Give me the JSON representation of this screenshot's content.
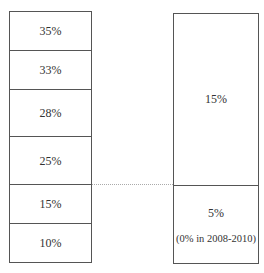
{
  "left_stack": {
    "segments": [
      {
        "label": "35%"
      },
      {
        "label": "33%"
      },
      {
        "label": "28%"
      },
      {
        "label": "25%"
      },
      {
        "label": "15%"
      },
      {
        "label": "10%"
      }
    ]
  },
  "right_stack": {
    "segments": [
      {
        "label": "15%",
        "note": ""
      },
      {
        "label": "5%",
        "note": "(0% in 2008-2010)"
      }
    ]
  },
  "connector": {
    "style": "dotted",
    "from": "left_stack.segments.4",
    "to": "right_stack.segments.1"
  }
}
